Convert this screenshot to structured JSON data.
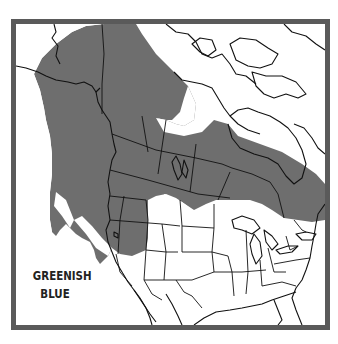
{
  "map": {
    "type": "range-map",
    "region": "North America",
    "label_line1": "GREENISH",
    "label_line2": "BLUE",
    "colors": {
      "frame": "#5a5a5a",
      "range_fill": "#6e6e6e",
      "land_outline": "#111111",
      "background": "#ffffff"
    }
  }
}
